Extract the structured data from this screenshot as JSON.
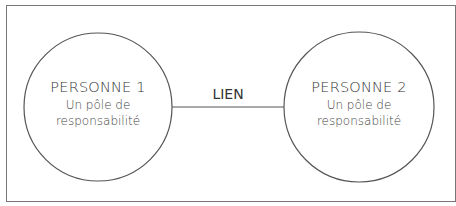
{
  "diagram": {
    "nodes": [
      {
        "title": "PERSONNE 1",
        "line1": "Un pôle de",
        "line2": "responsabilité"
      },
      {
        "title": "PERSONNE 2",
        "line1": "Un pôle de",
        "line2": "responsabilité"
      }
    ],
    "link": {
      "label": "LIEN"
    },
    "colors": {
      "stroke": "#555555",
      "frame": "#777777",
      "text": "#333333"
    }
  }
}
